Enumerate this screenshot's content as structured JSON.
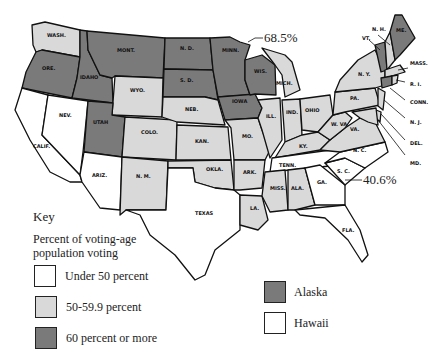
{
  "colors": {
    "under_50": "#ffffff",
    "mid_50_59": "#d9d9d9",
    "over_60": "#7a7a7a",
    "border": "#111111"
  },
  "callouts": {
    "max": "68.5%",
    "min": "40.6%"
  },
  "key": {
    "title": "Key",
    "subtitle_line1": "Percent of voting-age",
    "subtitle_line2": "population voting",
    "items": [
      {
        "label": "Under 50 percent",
        "category": "under_50"
      },
      {
        "label": "50-59.9 percent",
        "category": "mid_50_59"
      },
      {
        "label": "60 percent or more",
        "category": "over_60"
      }
    ],
    "extra": [
      {
        "label": "Alaska",
        "category": "over_60"
      },
      {
        "label": "Hawaii",
        "category": "under_50"
      }
    ]
  },
  "states": {
    "WASH": {
      "label": "WASH.",
      "category": "mid_50_59"
    },
    "ORE": {
      "label": "ORE.",
      "category": "over_60"
    },
    "CALIF": {
      "label": "CALIF.",
      "category": "under_50"
    },
    "IDAHO": {
      "label": "IDAHO",
      "category": "over_60"
    },
    "NEV": {
      "label": "NEV.",
      "category": "under_50"
    },
    "MONT": {
      "label": "MONT.",
      "category": "over_60"
    },
    "WYO": {
      "label": "WYO.",
      "category": "mid_50_59"
    },
    "UTAH": {
      "label": "UTAH",
      "category": "over_60"
    },
    "COLO": {
      "label": "COLO.",
      "category": "mid_50_59"
    },
    "ARIZ": {
      "label": "ARIZ.",
      "category": "under_50"
    },
    "NM": {
      "label": "N. M.",
      "category": "mid_50_59"
    },
    "ND": {
      "label": "N. D.",
      "category": "over_60"
    },
    "SD": {
      "label": "S. D.",
      "category": "over_60"
    },
    "NEB": {
      "label": "NEB.",
      "category": "mid_50_59"
    },
    "KAN": {
      "label": "KAN.",
      "category": "mid_50_59"
    },
    "OKLA": {
      "label": "OKLA.",
      "category": "mid_50_59"
    },
    "TEXAS": {
      "label": "TEXAS",
      "category": "under_50"
    },
    "MINN": {
      "label": "MINN.",
      "category": "over_60"
    },
    "IOWA": {
      "label": "IOWA",
      "category": "over_60"
    },
    "MO": {
      "label": "MO.",
      "category": "mid_50_59"
    },
    "ARK": {
      "label": "ARK.",
      "category": "mid_50_59"
    },
    "LA": {
      "label": "LA.",
      "category": "mid_50_59"
    },
    "WIS": {
      "label": "WIS.",
      "category": "over_60"
    },
    "ILL": {
      "label": "ILL.",
      "category": "mid_50_59"
    },
    "MICH": {
      "label": "MICH.",
      "category": "mid_50_59"
    },
    "IND": {
      "label": "IND.",
      "category": "mid_50_59"
    },
    "OHIO": {
      "label": "OHIO",
      "category": "mid_50_59"
    },
    "KY": {
      "label": "KY.",
      "category": "mid_50_59"
    },
    "TENN": {
      "label": "TENN.",
      "category": "under_50"
    },
    "MISS": {
      "label": "MISS.",
      "category": "mid_50_59"
    },
    "ALA": {
      "label": "ALA.",
      "category": "mid_50_59"
    },
    "GA": {
      "label": "GA.",
      "category": "under_50"
    },
    "FLA": {
      "label": "FLA.",
      "category": "under_50"
    },
    "SC": {
      "label": "S. C.",
      "category": "under_50"
    },
    "NC": {
      "label": "N. C.",
      "category": "under_50"
    },
    "VA": {
      "label": "VA.",
      "category": "mid_50_59"
    },
    "WVA": {
      "label": "W. VA.",
      "category": "mid_50_59"
    },
    "PA": {
      "label": "PA.",
      "category": "mid_50_59"
    },
    "NY": {
      "label": "N. Y.",
      "category": "mid_50_59"
    },
    "VT": {
      "label": "VT.",
      "category": "over_60"
    },
    "NH": {
      "label": "N. H.",
      "category": "mid_50_59"
    },
    "ME": {
      "label": "ME.",
      "category": "over_60"
    },
    "MASS": {
      "label": "MASS.",
      "category": "mid_50_59"
    },
    "RI": {
      "label": "R. I.",
      "category": "mid_50_59"
    },
    "CONN": {
      "label": "CONN.",
      "category": "over_60"
    },
    "NJ": {
      "label": "N. J.",
      "category": "mid_50_59"
    },
    "DEL": {
      "label": "DEL.",
      "category": "mid_50_59"
    },
    "MD": {
      "label": "MD.",
      "category": "mid_50_59"
    }
  }
}
